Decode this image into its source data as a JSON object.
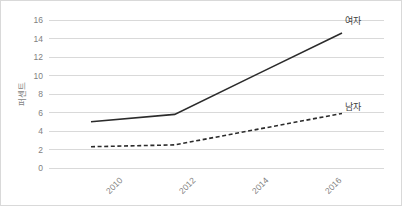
{
  "chart_data": {
    "type": "line",
    "title": "",
    "subtitle": "",
    "xlabel": "",
    "ylabel": "퍼센트",
    "x": [
      "2010",
      "2012",
      "2014",
      "2016"
    ],
    "categories": [
      "2010",
      "2012",
      "2014",
      "2016"
    ],
    "xtick_labels": [
      "2010",
      "2012",
      "2014",
      "2016"
    ],
    "ytick_labels": [
      "0",
      "2",
      "4",
      "6",
      "8",
      "10",
      "12",
      "14",
      "16"
    ],
    "ytick_values": [
      0,
      2,
      4,
      6,
      8,
      10,
      12,
      14,
      16
    ],
    "ylim": [
      0,
      16
    ],
    "grid": "horizontal",
    "legend_position": "inline-end-of-line",
    "series": [
      {
        "name": "여자",
        "style": "solid",
        "color": "#2b2b2b",
        "values": [
          5.0,
          5.8,
          10.2,
          14.6
        ],
        "label": "여자"
      },
      {
        "name": "남자",
        "style": "dashed",
        "color": "#2b2b2b",
        "values": [
          2.3,
          2.5,
          4.2,
          5.9
        ],
        "label": "남자"
      }
    ],
    "annotations": []
  },
  "colors": {
    "background": "#ffffff",
    "border": "#d9d9d9",
    "gridline": "#d9d9d9",
    "tick_text": "#7f7f7f",
    "series_line": "#2b2b2b",
    "series_label": "#3f3f3f"
  }
}
